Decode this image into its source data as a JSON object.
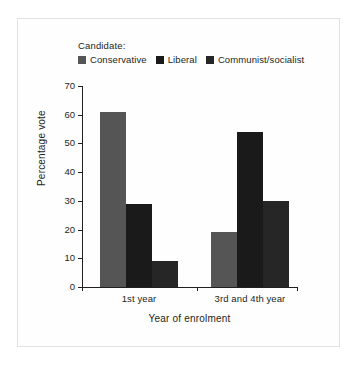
{
  "chart_data": {
    "type": "bar",
    "title": "",
    "subtitle": "",
    "xlabel": "Year of enrolment",
    "ylabel": "Percentage vote",
    "categories": [
      "1st year",
      "3rd and 4th year"
    ],
    "series": [
      {
        "name": "Conservative",
        "color": "#555555",
        "values": [
          61,
          19
        ]
      },
      {
        "name": "Liberal",
        "color": "#1a1a1a",
        "values": [
          29,
          54
        ]
      },
      {
        "name": "Communist/socialist",
        "color": "#262626",
        "values": [
          9,
          30
        ]
      }
    ],
    "ylim": [
      0,
      70
    ],
    "yticks": [
      0,
      10,
      20,
      30,
      40,
      50,
      60,
      70
    ],
    "ytick_labels": [
      "0",
      "10",
      "20",
      "30",
      "40",
      "50",
      "60",
      "70"
    ],
    "grid": false,
    "legend_position": "top",
    "legend_title": "Candidate:"
  },
  "figure": {
    "background": "#ffffff",
    "frame_color": "#e2e2e4",
    "axis_color": "#231f20",
    "text_color": "#231f20"
  }
}
